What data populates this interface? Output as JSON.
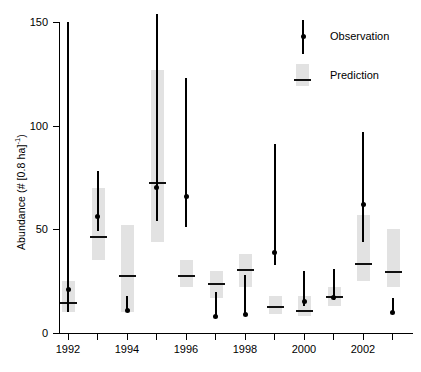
{
  "chart_data": {
    "type": "bar",
    "title": "",
    "xlabel": "",
    "ylabel": "Abundance  (# [0.8 ha]",
    "ylabel_exponent": "-1",
    "ylabel_tail": ")",
    "ylim": [
      0,
      160
    ],
    "xlim": [
      1991.5,
      2003.5
    ],
    "grid": false,
    "yticks": [
      0,
      50,
      100,
      150
    ],
    "ytick_labels": [
      "0",
      "50",
      "100",
      "150"
    ],
    "xticks": [
      1992,
      1993,
      1994,
      1995,
      1996,
      1997,
      1998,
      1999,
      2000,
      2001,
      2002,
      2003
    ],
    "xtick_labels": [
      "1992",
      "",
      "1994",
      "",
      "1996",
      "",
      "1998",
      "",
      "2000",
      "",
      "2002",
      ""
    ],
    "categories": [
      1992,
      1993,
      1994,
      1995,
      1996,
      1997,
      1998,
      1999,
      2000,
      2001,
      2002,
      2003
    ],
    "series": [
      {
        "name": "Observation",
        "type": "point-with-interval",
        "color": "#000000",
        "values": [
          21,
          56,
          11,
          70,
          66,
          8,
          9,
          39,
          15,
          17,
          62,
          10
        ],
        "lower": [
          10,
          49,
          10,
          54,
          51,
          8,
          9,
          33,
          13,
          16,
          44,
          9
        ],
        "upper": [
          150,
          78,
          18,
          154,
          123,
          20,
          28,
          91,
          30,
          31,
          97,
          17
        ]
      },
      {
        "name": "Prediction",
        "type": "box-with-median",
        "color": "#e2e2e2",
        "median_color": "#111111",
        "median": [
          15,
          47,
          28,
          73,
          28,
          24,
          31,
          13,
          11,
          18,
          34,
          30
        ],
        "box_lower": [
          10,
          35,
          10,
          44,
          22,
          17,
          22,
          9,
          8,
          13,
          25,
          22
        ],
        "box_upper": [
          25,
          70,
          52,
          127,
          35,
          30,
          38,
          18,
          18,
          22,
          57,
          50
        ]
      }
    ],
    "legend": {
      "position": "top-right",
      "entries": [
        {
          "label": "Observation",
          "marker": "line-with-dot",
          "color": "#000000"
        },
        {
          "label": "Prediction",
          "marker": "shaded-box-with-median",
          "color": "#e2e2e2"
        }
      ]
    }
  }
}
